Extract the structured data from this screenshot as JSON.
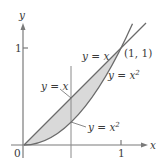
{
  "diagram": {
    "axes": {
      "x_label": "x",
      "y_label": "y",
      "origin_label": "0",
      "x_tick_label": "1",
      "y_tick_label": "1"
    },
    "curves": [
      {
        "name": "line",
        "equation_lhs": "y = x",
        "label_upper": "y = x",
        "label_lower": "y = x"
      },
      {
        "name": "parabola",
        "equation_base": "y = x",
        "exponent": "2"
      }
    ],
    "intersection_label": "(1, 1)",
    "labels": {
      "upper_line": "y = x",
      "upper_parabola_base": "y = x",
      "upper_parabola_exp": "2",
      "lower_line": "y = x",
      "lower_parabola_base": "y = x",
      "lower_parabola_exp": "2"
    },
    "colors": {
      "shaded_region": "#d9d9d9",
      "curves": "#6b6b6b",
      "axes": "#7a7a7a",
      "text": "#3a3a3a"
    }
  }
}
